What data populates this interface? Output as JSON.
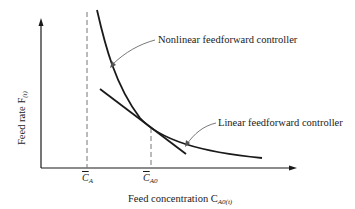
{
  "diagram": {
    "type": "line-curve-diagram",
    "x_axis": {
      "label_prefix": "Feed concentration C",
      "label_subscript": "A0(t)",
      "ticks": [
        {
          "id": "ca",
          "symbol": "C",
          "subscript": "A",
          "overbar": true
        },
        {
          "id": "ca0",
          "symbol": "C",
          "subscript": "A0",
          "overbar": true
        }
      ]
    },
    "y_axis": {
      "label_prefix": "Feed rate F",
      "label_subscript": "(t)"
    },
    "annotations": {
      "nonlinear": "Nonlinear feedforward controller",
      "linear": "Linear feedforward controller"
    },
    "curves": [
      {
        "name": "Nonlinear feedforward controller",
        "shape": "decreasing hyperbola"
      },
      {
        "name": "Linear feedforward controller",
        "shape": "straight line tangent at C_A0"
      }
    ],
    "colors": {
      "line": "#1a1a1a",
      "dashed": "#777777",
      "leader": "#555555"
    }
  }
}
